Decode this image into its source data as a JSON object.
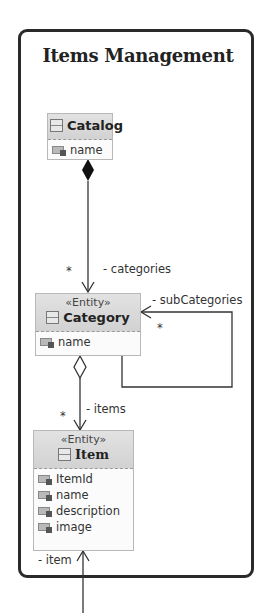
{
  "diagram": {
    "title": "Items Management",
    "classes": {
      "catalog": {
        "name": "Catalog",
        "stereotype": null,
        "attributes": [
          "name"
        ]
      },
      "category": {
        "name": "Category",
        "stereotype": "«Entity»",
        "attributes": [
          "name"
        ]
      },
      "item": {
        "name": "Item",
        "stereotype": "«Entity»",
        "attributes": [
          "ItemId",
          "name",
          "description",
          "image"
        ]
      }
    },
    "associations": {
      "catalog_categories": {
        "type": "composition",
        "role": "- categories",
        "multiplicity": "*"
      },
      "category_subcategories": {
        "type": "self-association",
        "role": "- subCategories",
        "multiplicity": "*"
      },
      "category_items": {
        "type": "aggregation",
        "role": "- items",
        "multiplicity": "*"
      },
      "external_item": {
        "type": "association",
        "role": "- item"
      }
    },
    "icons": {
      "class": "class-icon",
      "attribute": "attribute-icon"
    }
  }
}
